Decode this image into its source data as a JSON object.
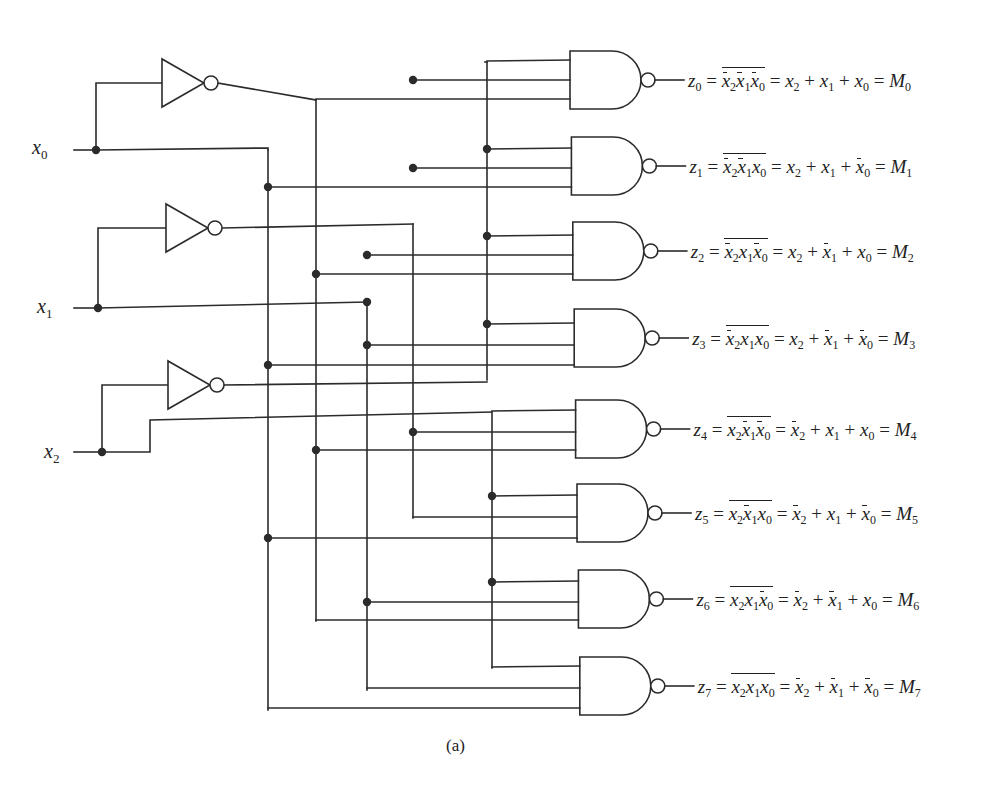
{
  "figure": {
    "caption": "(a)"
  },
  "inputs": [
    {
      "id": "x0",
      "var": "x",
      "sub": "0",
      "label_x": 32,
      "label_y": 158,
      "line_y": 150,
      "node_x": 96
    },
    {
      "id": "x1",
      "var": "x",
      "sub": "1",
      "label_x": 37,
      "label_y": 317,
      "line_y": 308,
      "node_x": 98
    },
    {
      "id": "x2",
      "var": "x",
      "sub": "2",
      "label_x": 44,
      "label_y": 462,
      "line_y": 452,
      "node_x": 102
    }
  ],
  "inverters": [
    {
      "id": "inv0",
      "in_y": 83,
      "x": 162,
      "y": 83,
      "out_y": 100,
      "label": "NOT x0"
    },
    {
      "id": "inv1",
      "in_y": 228,
      "x": 166,
      "y": 228,
      "out_y": 224,
      "label": "NOT x1"
    },
    {
      "id": "inv2",
      "in_y": 385,
      "x": 168,
      "y": 385,
      "out_y": 382,
      "label": "NOT x2"
    }
  ],
  "buses": [
    {
      "id": "x0_true",
      "x": 268,
      "y1": 150,
      "y2": 710
    },
    {
      "id": "x0_comp",
      "x": 316,
      "y1": 100,
      "y2": 621
    },
    {
      "id": "x1_true",
      "x": 367,
      "y1": 302,
      "y2": 690
    },
    {
      "id": "x1_comp",
      "x": 413,
      "y1": 224,
      "y2": 518
    },
    {
      "id": "x2_comp",
      "x": 487,
      "y1": 62,
      "y2": 380
    },
    {
      "id": "x2_true",
      "x": 492,
      "y1": 412,
      "y2": 668
    }
  ],
  "gates": [
    {
      "index": 0,
      "cy": 80,
      "inputs": [
        {
          "bus": "x2_comp",
          "y": 61
        },
        {
          "bus": "x1_comp",
          "y": 80
        },
        {
          "bus": "x0_comp",
          "y": 99
        }
      ]
    },
    {
      "index": 1,
      "cy": 166,
      "inputs": [
        {
          "bus": "x2_comp",
          "y": 149
        },
        {
          "bus": "x1_comp",
          "y": 168
        },
        {
          "bus": "x0_true",
          "y": 187
        }
      ]
    },
    {
      "index": 2,
      "cy": 251,
      "inputs": [
        {
          "bus": "x2_comp",
          "y": 236
        },
        {
          "bus": "x1_true",
          "y": 255
        },
        {
          "bus": "x0_comp",
          "y": 274
        }
      ]
    },
    {
      "index": 3,
      "cy": 338,
      "inputs": [
        {
          "bus": "x2_comp",
          "y": 324
        },
        {
          "bus": "x1_true",
          "y": 345
        },
        {
          "bus": "x0_true",
          "y": 365
        }
      ]
    },
    {
      "index": 4,
      "cy": 426,
      "inputs": [
        {
          "bus": "x2_true",
          "y": 411
        },
        {
          "bus": "x1_comp",
          "y": 432
        },
        {
          "bus": "x0_comp",
          "y": 450
        }
      ]
    },
    {
      "index": 5,
      "cy": 510,
      "inputs": [
        {
          "bus": "x2_true",
          "y": 496
        },
        {
          "bus": "x1_comp",
          "y": 517
        },
        {
          "bus": "x0_true",
          "y": 538
        }
      ]
    },
    {
      "index": 6,
      "cy": 596,
      "inputs": [
        {
          "bus": "x2_true",
          "y": 582
        },
        {
          "bus": "x1_true",
          "y": 602
        },
        {
          "bus": "x0_comp",
          "y": 620
        }
      ]
    },
    {
      "index": 7,
      "cy": 683,
      "inputs": [
        {
          "bus": "x2_true",
          "y": 667
        },
        {
          "bus": "x1_true",
          "y": 688
        },
        {
          "bus": "x0_true",
          "y": 708
        }
      ]
    }
  ],
  "outputs": [
    {
      "z": "z",
      "sub": "0",
      "nand": [
        [
          "x",
          "2",
          true
        ],
        [
          "x",
          "1",
          true
        ],
        [
          "x",
          "0",
          true
        ]
      ],
      "sum": [
        [
          "x",
          "2",
          false
        ],
        [
          "x",
          "1",
          false
        ],
        [
          "x",
          "0",
          false
        ]
      ],
      "M": "M",
      "Msub": "0"
    },
    {
      "z": "z",
      "sub": "1",
      "nand": [
        [
          "x",
          "2",
          true
        ],
        [
          "x",
          "1",
          true
        ],
        [
          "x",
          "0",
          false
        ]
      ],
      "sum": [
        [
          "x",
          "2",
          false
        ],
        [
          "x",
          "1",
          false
        ],
        [
          "x",
          "0",
          true
        ]
      ],
      "M": "M",
      "Msub": "1"
    },
    {
      "z": "z",
      "sub": "2",
      "nand": [
        [
          "x",
          "2",
          true
        ],
        [
          "x",
          "1",
          false
        ],
        [
          "x",
          "0",
          true
        ]
      ],
      "sum": [
        [
          "x",
          "2",
          false
        ],
        [
          "x",
          "1",
          true
        ],
        [
          "x",
          "0",
          false
        ]
      ],
      "M": "M",
      "Msub": "2"
    },
    {
      "z": "z",
      "sub": "3",
      "nand": [
        [
          "x",
          "2",
          true
        ],
        [
          "x",
          "1",
          false
        ],
        [
          "x",
          "0",
          false
        ]
      ],
      "sum": [
        [
          "x",
          "2",
          false
        ],
        [
          "x",
          "1",
          true
        ],
        [
          "x",
          "0",
          true
        ]
      ],
      "M": "M",
      "Msub": "3"
    },
    {
      "z": "z",
      "sub": "4",
      "nand": [
        [
          "x",
          "2",
          false
        ],
        [
          "x",
          "1",
          true
        ],
        [
          "x",
          "0",
          true
        ]
      ],
      "sum": [
        [
          "x",
          "2",
          true
        ],
        [
          "x",
          "1",
          false
        ],
        [
          "x",
          "0",
          false
        ]
      ],
      "M": "M",
      "Msub": "4"
    },
    {
      "z": "z",
      "sub": "5",
      "nand": [
        [
          "x",
          "2",
          false
        ],
        [
          "x",
          "1",
          true
        ],
        [
          "x",
          "0",
          false
        ]
      ],
      "sum": [
        [
          "x",
          "2",
          true
        ],
        [
          "x",
          "1",
          false
        ],
        [
          "x",
          "0",
          true
        ]
      ],
      "M": "M",
      "Msub": "5"
    },
    {
      "z": "z",
      "sub": "6",
      "nand": [
        [
          "x",
          "2",
          false
        ],
        [
          "x",
          "1",
          false
        ],
        [
          "x",
          "0",
          true
        ]
      ],
      "sum": [
        [
          "x",
          "2",
          true
        ],
        [
          "x",
          "1",
          true
        ],
        [
          "x",
          "0",
          false
        ]
      ],
      "M": "M",
      "Msub": "6"
    },
    {
      "z": "z",
      "sub": "7",
      "nand": [
        [
          "x",
          "2",
          false
        ],
        [
          "x",
          "1",
          false
        ],
        [
          "x",
          "0",
          false
        ]
      ],
      "sum": [
        [
          "x",
          "2",
          true
        ],
        [
          "x",
          "1",
          true
        ],
        [
          "x",
          "0",
          true
        ]
      ],
      "M": "M",
      "Msub": "7"
    }
  ],
  "equations_text": [
    "z0 = NOT(x̄2 x̄1 x̄0) = x2 + x1 + x0 = M0",
    "z1 = NOT(x̄2 x̄1 x0) = x2 + x1 + x̄0 = M1",
    "z2 = NOT(x̄2 x1 x̄0) = x2 + x̄1 + x0 = M2",
    "z3 = NOT(x̄2 x1 x0) = x2 + x̄1 + x̄0 = M3",
    "z4 = NOT(x2 x̄1 x̄0) = x̄2 + x1 + x0 = M4",
    "z5 = NOT(x2 x̄1 x0) = x̄2 + x1 + x̄0 = M5",
    "z6 = NOT(x2 x1 x̄0) = x̄2 + x̄1 + x0 = M6",
    "z7 = NOT(x2 x1 x0) = x̄2 + x̄1 + x̄0 = M7"
  ],
  "colors": {
    "ink": "#2b2b2b",
    "background": "#ffffff"
  }
}
